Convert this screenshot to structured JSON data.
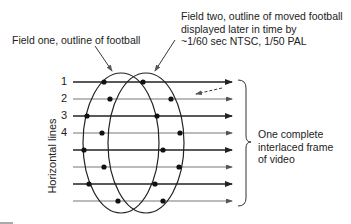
{
  "labels": {
    "field_one": "Field one, outline of football",
    "field_two_lines": [
      "Field two, outline of moved football",
      "displayed later in time by",
      "~1/60 sec NTSC, 1/50 PAL"
    ],
    "frame_lines": [
      "One complete",
      "interlaced frame",
      "of video"
    ],
    "axis_label": "Horizontal lines"
  },
  "line_numbers": [
    "1",
    "2",
    "3",
    "4"
  ],
  "diagram": {
    "horizontal_line_count": 8,
    "line_y": [
      82,
      99,
      116,
      133,
      150,
      167,
      184,
      201
    ],
    "field_one_lines": [
      1,
      3,
      5,
      7
    ],
    "field_two_lines": [
      2,
      4,
      6,
      8
    ],
    "colors": {
      "stroke": "#222222",
      "light_stroke": "#777777",
      "text": "#222222"
    }
  }
}
